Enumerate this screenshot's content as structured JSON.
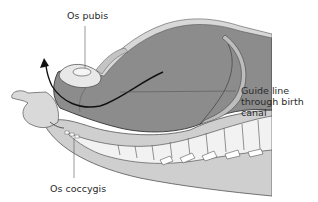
{
  "figure": {
    "type": "anatomical-diagram"
  },
  "labels": {
    "os_pubis": "Os pubis",
    "guide_line": "Guide line\nthrough birth\ncanal",
    "os_coccygis": "Os coccygis"
  },
  "colors": {
    "background": "#ffffff",
    "outer_tissue": "#c9c9c9",
    "inner_cavity": "#8a8a8a",
    "mid_tissue": "#a6a6a6",
    "bone_light": "#e6e6e6",
    "outline": "#3a3a3a",
    "guide_line": "#111111",
    "leader_line": "#555555"
  }
}
